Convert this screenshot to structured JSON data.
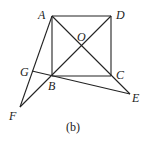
{
  "diagram": {
    "caption": "(b)",
    "points": {
      "A": {
        "label": "A",
        "x": 52,
        "y": 16
      },
      "D": {
        "label": "D",
        "x": 111,
        "y": 16
      },
      "C": {
        "label": "C",
        "x": 111,
        "y": 76
      },
      "B": {
        "label": "B",
        "x": 52,
        "y": 76
      },
      "O": {
        "label": "O",
        "x": 81.5,
        "y": 46
      },
      "E": {
        "label": "E",
        "x": 130,
        "y": 94
      },
      "F": {
        "label": "F",
        "x": 20,
        "y": 107
      },
      "G": {
        "label": "G",
        "x": 32,
        "y": 71
      }
    },
    "segments": [
      "AD",
      "DC",
      "CB",
      "BA",
      "AE",
      "DF",
      "AF",
      "GE"
    ]
  }
}
